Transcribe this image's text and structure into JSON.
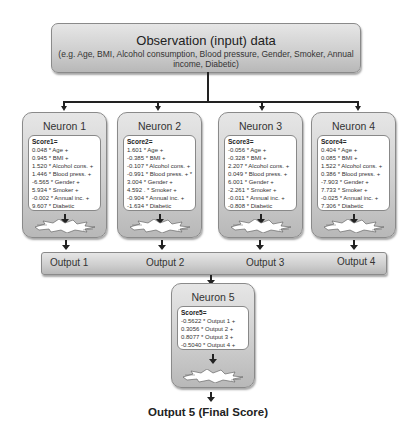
{
  "observation": {
    "title": "Observation (input) data",
    "subtitle": "(e.g. Age, BMI, Alcohol consumption, Blood pressure, Gender, Smoker, Annual income, Diabetic)"
  },
  "neurons": [
    {
      "title": "Neuron 1",
      "score_label": "Score1=",
      "terms": [
        "0.048 * Age +",
        "0.945 * BMI +",
        "1.520 * Alcohol cons. +",
        "1.446 * Blood press. +",
        "-6.565 * Gender +",
        "5.934 * Smoker +",
        "-0.002 * Annual inc. +",
        "9.607 * Diabetic"
      ]
    },
    {
      "title": "Neuron 2",
      "score_label": "Score2=",
      "terms": [
        "1.601 * Age +",
        "-0.385 * BMI +",
        "-0.107 * Alcohol cons. +",
        "-0.991 * Blood press. + *",
        "3.004 * Gender +",
        "4.592 . * Smoker +",
        "-0.904 * Annual inc. +",
        "-1.634 * Diabetic"
      ]
    },
    {
      "title": "Neuron 3",
      "score_label": "Score3=",
      "terms": [
        "-0.056 * Age +",
        "-0.328 * BMI +",
        "2.207 * Alcohol cons. +",
        "0.049 * Blood press. +",
        "6.001 * Gender +",
        "-2.261 * Smoker +",
        "-0.011 * Annual inc. +",
        "-0.808 * Diabetic"
      ]
    },
    {
      "title": "Neuron 4",
      "score_label": "Score4=",
      "terms": [
        "0.404 * Age +",
        "0.085 * BMI +",
        "1.522 * Alcohol cons. +",
        "0.386 * Blood press. +",
        "-7.903 * Gender +",
        "7.733 * Smoker +",
        "-0.025 * Annual inc. +",
        "7.306 * Diabetic"
      ]
    }
  ],
  "outputs": [
    "Output 1",
    "Output 2",
    "Output 3",
    "Output 4"
  ],
  "neuron5": {
    "title": "Neuron 5",
    "score_label": "Score5=",
    "terms": [
      "-0.5622 * Output 1 +",
      "0.3056 * Output 2 +",
      "0.8077 * Output 3 +",
      "-0.5040 * Output 4 +"
    ]
  },
  "final_output": "Output 5 (Final Score)",
  "colors": {
    "box_fill_top": "#e6e6e6",
    "box_fill_bottom": "#b8b8b8",
    "line": "#222222"
  }
}
